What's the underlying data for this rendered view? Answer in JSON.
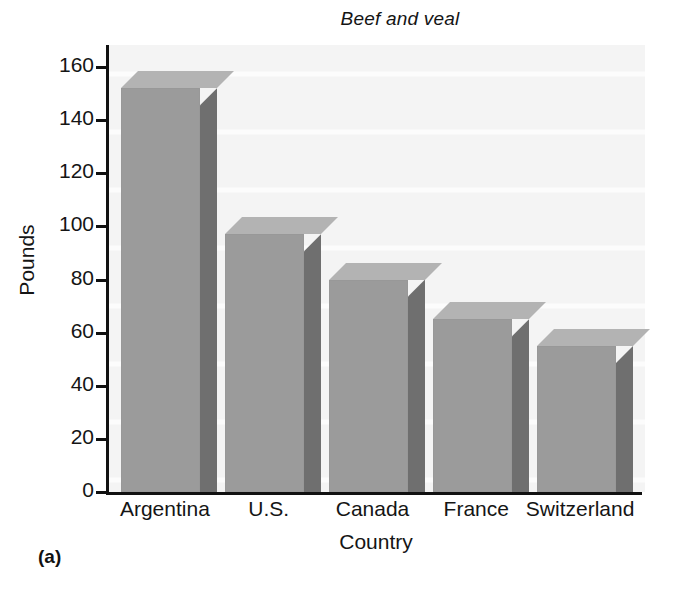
{
  "figure": {
    "caption": "(a)"
  },
  "chart_data": {
    "type": "bar",
    "title": "Beef and veal",
    "xlabel": "Country",
    "ylabel": "Pounds",
    "categories": [
      "Argentina",
      "U.S.",
      "Canada",
      "France",
      "Switzerland"
    ],
    "values": [
      152,
      97,
      80,
      65,
      55
    ],
    "ylim": [
      0,
      160
    ],
    "ytick_labels": [
      "0",
      "20",
      "40",
      "60",
      "80",
      "100",
      "120",
      "140",
      "160"
    ],
    "ytick_values": [
      0,
      20,
      40,
      60,
      80,
      100,
      120,
      140,
      160
    ],
    "grid": false,
    "legend": null,
    "style": "3d-bars",
    "colors": {
      "bar_front": "#9b9b9b",
      "bar_side": "#6f6f6f",
      "bar_top": "#b3b3b3",
      "plot_background": "#f4f4f4",
      "axis": "#111111",
      "text": "#151515"
    }
  }
}
